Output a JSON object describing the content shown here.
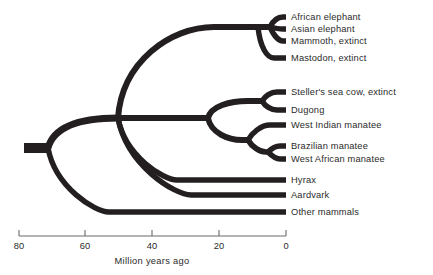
{
  "figure": {
    "type": "phylogenetic-tree",
    "title": "",
    "line_color": "#231f20",
    "text_color": "#2b2b2b",
    "background": "#ffffff"
  },
  "axis": {
    "label": "Million years ago",
    "ticks": [
      {
        "value": "80",
        "x": 19
      },
      {
        "value": "60",
        "x": 85
      },
      {
        "value": "40",
        "x": 152
      },
      {
        "value": "20",
        "x": 219
      },
      {
        "value": "0",
        "x": 286
      }
    ],
    "range_start": 80,
    "range_end": 0,
    "direction": "right-to-left",
    "axis_y": 236,
    "tick_length": 6,
    "label_x": 152,
    "label_y": 256,
    "tick_label_y": 241,
    "pixels_per_myr": 3.3375
  },
  "taxa": [
    {
      "id": "african-elephant",
      "label": "African elephant",
      "tip_y": 17,
      "label_x": 291,
      "label_y": 12
    },
    {
      "id": "asian-elephant",
      "label": "Asian elephant",
      "tip_y": 29,
      "label_x": 291,
      "label_y": 24
    },
    {
      "id": "mammoth",
      "label": "Mammoth, extinct",
      "tip_y": 41,
      "label_x": 291,
      "label_y": 36
    },
    {
      "id": "mastodon",
      "label": "Mastodon, extinct",
      "tip_y": 58,
      "label_x": 291,
      "label_y": 53
    },
    {
      "id": "stellers-sea-cow",
      "label": "Steller's sea cow, extinct",
      "tip_y": 92,
      "label_x": 291,
      "label_y": 87
    },
    {
      "id": "dugong",
      "label": "Dugong",
      "tip_y": 110,
      "label_x": 291,
      "label_y": 105
    },
    {
      "id": "west-indian-manatee",
      "label": "West Indian manatee",
      "tip_y": 125,
      "label_x": 291,
      "label_y": 120
    },
    {
      "id": "brazilian-manatee",
      "label": "Brazilian manatee",
      "tip_y": 146,
      "label_x": 291,
      "label_y": 141
    },
    {
      "id": "west-african-manatee",
      "label": "West African manatee",
      "tip_y": 159,
      "label_x": 291,
      "label_y": 154
    },
    {
      "id": "hyrax",
      "label": "Hyrax",
      "tip_y": 180,
      "label_x": 291,
      "label_y": 175
    },
    {
      "id": "aardvark",
      "label": "Aardvark",
      "tip_y": 195,
      "label_x": 291,
      "label_y": 190
    },
    {
      "id": "other-mammals",
      "label": "Other mammals",
      "tip_y": 212,
      "label_x": 291,
      "label_y": 207
    }
  ],
  "chart_data": {
    "type": "tree",
    "title": "",
    "xlabel": "Million years ago",
    "ylabel": "",
    "xlim": [
      80,
      0
    ],
    "xticks": [
      80,
      60,
      40,
      20,
      0
    ],
    "grid": false,
    "legend": "none",
    "tips": [
      "African elephant",
      "Asian elephant",
      "Mammoth, extinct",
      "Mastodon, extinct",
      "Steller's sea cow, extinct",
      "Dugong",
      "West Indian manatee",
      "Brazilian manatee",
      "West African manatee",
      "Hyrax",
      "Aardvark",
      "Other mammals"
    ],
    "nodes": [
      {
        "id": "root",
        "age_mya": 77,
        "children": [
          "other-mammals",
          "n-paenungulata-stem"
        ]
      },
      {
        "id": "n-paenungulata-stem",
        "age_mya": 56,
        "children": [
          "elephants-stem",
          "sirenia-stem",
          "hyrax",
          "aardvark"
        ]
      },
      {
        "id": "elephants-stem",
        "age_mya": 9,
        "children": [
          "mastodon",
          "elephant-crown"
        ]
      },
      {
        "id": "elephant-crown",
        "age_mya": 5,
        "children": [
          "african-elephant",
          "asian-elephant",
          "mammoth"
        ]
      },
      {
        "id": "sirenia-stem",
        "age_mya": 23,
        "children": [
          "dugongidae",
          "trichechidae"
        ]
      },
      {
        "id": "dugongidae",
        "age_mya": 7,
        "children": [
          "stellers-sea-cow",
          "dugong"
        ]
      },
      {
        "id": "trichechidae",
        "age_mya": 11,
        "children": [
          "west-indian-manatee",
          "manatee-pair"
        ]
      },
      {
        "id": "manatee-pair",
        "age_mya": 5,
        "children": [
          "brazilian-manatee",
          "west-african-manatee"
        ]
      }
    ]
  },
  "geometry": {
    "tip_x": 286,
    "root_stub_x": 24,
    "root_node_x": 48,
    "paen_node_x": 118,
    "eleph_stem_node_x": 258,
    "eleph_crown_x": 270,
    "sirenia_node_x": 208,
    "dugongid_node_x": 262,
    "trichechid_node_x": 248,
    "manatee_pair_x": 268,
    "branch_width": 5.4,
    "stub_width": 10
  }
}
